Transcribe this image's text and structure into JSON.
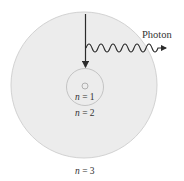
{
  "diagram": {
    "orbits": [
      {
        "label_var": "n",
        "label_eq": " = 1",
        "level": 1
      },
      {
        "label_var": "n",
        "label_eq": " = 2",
        "level": 2
      },
      {
        "label_var": "n",
        "label_eq": " = 3",
        "level": 3
      }
    ],
    "photon_label": "Photon",
    "colors": {
      "outer_fill": "#ececec",
      "outer_stroke": "#cfcfcf",
      "line": "#2b2b2b"
    }
  }
}
